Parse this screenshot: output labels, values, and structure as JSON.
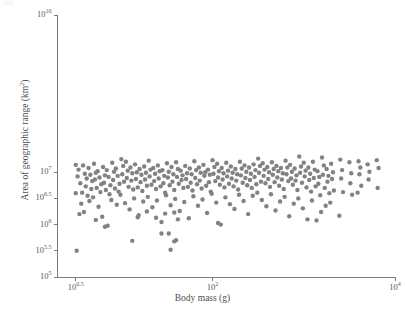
{
  "figure": {
    "caption_fragment": "(B)",
    "marker_color": "#808285",
    "axis_color": "#6d6e71",
    "background": "#ffffff"
  },
  "chart_data": {
    "type": "scatter",
    "title": "",
    "xlabel": "Body mass (g)",
    "ylabel": "Area of geographic range (km²)",
    "xscale": "log",
    "yscale": "log",
    "xlim_log10": [
      0.3,
      4.0
    ],
    "ylim_log10": [
      5.0,
      10.0
    ],
    "grid": false,
    "legend": null,
    "xticks_log10": [
      0.5,
      2.0,
      4.0
    ],
    "xtick_labels": [
      "10^0.5",
      "10^2",
      "10^4"
    ],
    "yticks_log10": [
      5.0,
      5.5,
      6.0,
      6.5,
      7.0,
      10.0
    ],
    "ytick_labels": [
      "10^5",
      "10^5.5",
      "10^6",
      "10^6.5",
      "10^7",
      "10^10"
    ],
    "marker_size_px": 4.4,
    "n_points": 301,
    "points_log10": [
      [
        0.5,
        7.14
      ],
      [
        0.52,
        6.92
      ],
      [
        0.5,
        6.6
      ],
      [
        0.51,
        5.5
      ],
      [
        0.53,
        7.05
      ],
      [
        0.55,
        6.79
      ],
      [
        0.57,
        6.61
      ],
      [
        0.56,
        6.4
      ],
      [
        0.54,
        6.2
      ],
      [
        0.58,
        7.13
      ],
      [
        0.6,
        6.97
      ],
      [
        0.62,
        6.88
      ],
      [
        0.61,
        6.73
      ],
      [
        0.63,
        6.55
      ],
      [
        0.59,
        6.24
      ],
      [
        0.64,
        7.08
      ],
      [
        0.66,
        6.95
      ],
      [
        0.68,
        6.83
      ],
      [
        0.67,
        6.68
      ],
      [
        0.65,
        6.45
      ],
      [
        0.7,
        7.16
      ],
      [
        0.72,
        6.99
      ],
      [
        0.71,
        6.86
      ],
      [
        0.73,
        6.7
      ],
      [
        0.69,
        6.52
      ],
      [
        0.74,
        7.02
      ],
      [
        0.76,
        6.9
      ],
      [
        0.78,
        6.77
      ],
      [
        0.77,
        6.62
      ],
      [
        0.75,
        6.34
      ],
      [
        0.8,
        7.1
      ],
      [
        0.82,
        6.94
      ],
      [
        0.81,
        6.8
      ],
      [
        0.83,
        6.66
      ],
      [
        0.79,
        6.15
      ],
      [
        0.84,
        7.04
      ],
      [
        0.86,
        6.91
      ],
      [
        0.88,
        6.75
      ],
      [
        0.87,
        6.58
      ],
      [
        0.85,
        5.98
      ],
      [
        0.9,
        7.18
      ],
      [
        0.92,
        7.01
      ],
      [
        0.91,
        6.85
      ],
      [
        0.93,
        6.69
      ],
      [
        0.89,
        6.47
      ],
      [
        0.94,
        7.07
      ],
      [
        0.96,
        6.93
      ],
      [
        0.98,
        6.78
      ],
      [
        0.97,
        6.63
      ],
      [
        0.95,
        6.38
      ],
      [
        1.0,
        7.25
      ],
      [
        1.02,
        7.12
      ],
      [
        1.01,
        6.96
      ],
      [
        1.03,
        6.82
      ],
      [
        0.99,
        6.57
      ],
      [
        1.05,
        7.2
      ],
      [
        1.07,
        7.03
      ],
      [
        1.06,
        6.89
      ],
      [
        1.08,
        6.72
      ],
      [
        1.04,
        6.41
      ],
      [
        1.1,
        7.09
      ],
      [
        1.12,
        6.98
      ],
      [
        1.11,
        6.84
      ],
      [
        1.13,
        6.67
      ],
      [
        1.09,
        6.29
      ],
      [
        1.15,
        7.15
      ],
      [
        1.17,
        7.0
      ],
      [
        1.16,
        6.87
      ],
      [
        1.18,
        6.71
      ],
      [
        1.14,
        6.5
      ],
      [
        1.2,
        7.06
      ],
      [
        1.22,
        6.95
      ],
      [
        1.21,
        6.81
      ],
      [
        1.23,
        6.64
      ],
      [
        1.19,
        6.18
      ],
      [
        1.25,
        7.11
      ],
      [
        1.27,
        6.99
      ],
      [
        1.26,
        6.86
      ],
      [
        1.28,
        6.74
      ],
      [
        1.24,
        6.44
      ],
      [
        1.3,
        7.22
      ],
      [
        1.32,
        7.05
      ],
      [
        1.31,
        6.92
      ],
      [
        1.33,
        6.76
      ],
      [
        1.29,
        6.53
      ],
      [
        1.35,
        7.08
      ],
      [
        1.37,
        6.97
      ],
      [
        1.36,
        6.83
      ],
      [
        1.38,
        6.68
      ],
      [
        1.34,
        6.33
      ],
      [
        1.4,
        7.13
      ],
      [
        1.42,
        7.02
      ],
      [
        1.41,
        6.88
      ],
      [
        1.43,
        6.73
      ],
      [
        1.39,
        6.46
      ],
      [
        1.45,
        7.04
      ],
      [
        1.47,
        6.93
      ],
      [
        1.46,
        6.79
      ],
      [
        1.48,
        6.61
      ],
      [
        1.44,
        6.05
      ],
      [
        1.5,
        7.17
      ],
      [
        1.52,
        7.01
      ],
      [
        1.51,
        6.9
      ],
      [
        1.53,
        6.75
      ],
      [
        1.49,
        6.56
      ],
      [
        1.55,
        7.1
      ],
      [
        1.57,
        6.96
      ],
      [
        1.56,
        6.82
      ],
      [
        1.58,
        6.66
      ],
      [
        1.54,
        6.37
      ],
      [
        1.6,
        7.19
      ],
      [
        1.62,
        7.06
      ],
      [
        1.61,
        6.91
      ],
      [
        1.63,
        6.78
      ],
      [
        1.59,
        6.49
      ],
      [
        1.65,
        7.03
      ],
      [
        1.67,
        6.94
      ],
      [
        1.66,
        6.85
      ],
      [
        1.68,
        6.7
      ],
      [
        1.64,
        6.26
      ],
      [
        1.7,
        7.12
      ],
      [
        1.72,
        6.98
      ],
      [
        1.71,
        6.87
      ],
      [
        1.73,
        6.72
      ],
      [
        1.69,
        6.43
      ],
      [
        1.75,
        7.07
      ],
      [
        1.77,
        6.96
      ],
      [
        1.76,
        6.8
      ],
      [
        1.78,
        6.65
      ],
      [
        1.74,
        6.12
      ],
      [
        1.8,
        7.21
      ],
      [
        1.82,
        7.04
      ],
      [
        1.81,
        6.89
      ],
      [
        1.83,
        6.77
      ],
      [
        1.79,
        6.54
      ],
      [
        1.85,
        7.09
      ],
      [
        1.87,
        6.99
      ],
      [
        1.86,
        6.84
      ],
      [
        1.88,
        6.69
      ],
      [
        1.84,
        6.36
      ],
      [
        1.9,
        7.14
      ],
      [
        1.92,
        7.0
      ],
      [
        1.91,
        6.93
      ],
      [
        1.93,
        6.74
      ],
      [
        1.89,
        6.48
      ],
      [
        1.95,
        7.05
      ],
      [
        1.97,
        6.95
      ],
      [
        1.96,
        6.81
      ],
      [
        1.98,
        6.63
      ],
      [
        1.94,
        6.22
      ],
      [
        2.0,
        7.23
      ],
      [
        2.02,
        7.1
      ],
      [
        2.01,
        6.97
      ],
      [
        2.03,
        6.83
      ],
      [
        1.99,
        6.59
      ],
      [
        2.05,
        7.16
      ],
      [
        2.07,
        7.02
      ],
      [
        2.06,
        6.9
      ],
      [
        2.08,
        6.76
      ],
      [
        2.04,
        6.42
      ],
      [
        2.1,
        7.08
      ],
      [
        2.12,
        6.98
      ],
      [
        2.11,
        6.86
      ],
      [
        2.13,
        6.71
      ],
      [
        2.09,
        6.0
      ],
      [
        2.15,
        7.18
      ],
      [
        2.17,
        7.03
      ],
      [
        2.16,
        6.92
      ],
      [
        2.18,
        6.78
      ],
      [
        2.14,
        6.52
      ],
      [
        2.2,
        7.11
      ],
      [
        2.22,
        6.99
      ],
      [
        2.21,
        6.88
      ],
      [
        2.23,
        6.73
      ],
      [
        2.19,
        6.39
      ],
      [
        2.25,
        7.06
      ],
      [
        2.27,
        6.96
      ],
      [
        2.26,
        6.84
      ],
      [
        2.28,
        6.67
      ],
      [
        2.24,
        6.3
      ],
      [
        2.3,
        7.2
      ],
      [
        2.32,
        7.07
      ],
      [
        2.31,
        6.94
      ],
      [
        2.33,
        6.8
      ],
      [
        2.29,
        6.57
      ],
      [
        2.35,
        7.13
      ],
      [
        2.37,
        7.01
      ],
      [
        2.36,
        6.89
      ],
      [
        2.38,
        6.75
      ],
      [
        2.34,
        6.45
      ],
      [
        2.4,
        7.09
      ],
      [
        2.42,
        6.97
      ],
      [
        2.41,
        6.85
      ],
      [
        2.43,
        6.7
      ],
      [
        2.39,
        6.2
      ],
      [
        2.45,
        7.15
      ],
      [
        2.47,
        7.04
      ],
      [
        2.46,
        6.91
      ],
      [
        2.48,
        6.77
      ],
      [
        2.44,
        6.55
      ],
      [
        2.5,
        7.26
      ],
      [
        2.52,
        7.12
      ],
      [
        2.51,
        6.99
      ],
      [
        2.53,
        6.82
      ],
      [
        2.49,
        6.61
      ],
      [
        2.55,
        7.17
      ],
      [
        2.57,
        7.05
      ],
      [
        2.56,
        6.93
      ],
      [
        2.58,
        6.79
      ],
      [
        2.54,
        6.47
      ],
      [
        2.6,
        7.1
      ],
      [
        2.62,
        7.0
      ],
      [
        2.61,
        6.87
      ],
      [
        2.63,
        6.72
      ],
      [
        2.59,
        6.35
      ],
      [
        2.65,
        7.19
      ],
      [
        2.67,
        7.06
      ],
      [
        2.66,
        6.95
      ],
      [
        2.68,
        6.81
      ],
      [
        2.64,
        6.58
      ],
      [
        2.7,
        7.12
      ],
      [
        2.72,
        7.02
      ],
      [
        2.71,
        6.9
      ],
      [
        2.73,
        6.74
      ],
      [
        2.69,
        6.27
      ],
      [
        2.75,
        7.08
      ],
      [
        2.77,
        6.98
      ],
      [
        2.76,
        6.86
      ],
      [
        2.78,
        6.68
      ],
      [
        2.74,
        6.44
      ],
      [
        2.8,
        7.22
      ],
      [
        2.82,
        7.09
      ],
      [
        2.81,
        6.96
      ],
      [
        2.83,
        6.83
      ],
      [
        2.79,
        6.53
      ],
      [
        2.85,
        7.14
      ],
      [
        2.87,
        7.01
      ],
      [
        2.86,
        6.88
      ],
      [
        2.88,
        6.76
      ],
      [
        2.84,
        6.16
      ],
      [
        2.9,
        7.07
      ],
      [
        2.92,
        6.94
      ],
      [
        2.91,
        6.84
      ],
      [
        2.93,
        6.66
      ],
      [
        2.89,
        6.4
      ],
      [
        2.95,
        7.3
      ],
      [
        2.97,
        7.11
      ],
      [
        2.96,
        6.99
      ],
      [
        2.98,
        6.8
      ],
      [
        2.94,
        6.5
      ],
      [
        3.0,
        7.18
      ],
      [
        3.02,
        7.03
      ],
      [
        3.01,
        6.92
      ],
      [
        3.03,
        6.71
      ],
      [
        2.99,
        6.31
      ],
      [
        3.05,
        7.09
      ],
      [
        3.07,
        6.97
      ],
      [
        3.06,
        6.85
      ],
      [
        3.08,
        6.63
      ],
      [
        3.04,
        6.1
      ],
      [
        3.1,
        7.2
      ],
      [
        3.12,
        7.05
      ],
      [
        3.11,
        6.89
      ],
      [
        3.13,
        6.73
      ],
      [
        3.09,
        6.46
      ],
      [
        3.15,
        7.02
      ],
      [
        3.17,
        6.91
      ],
      [
        3.16,
        6.78
      ],
      [
        3.18,
        6.56
      ],
      [
        3.14,
        6.08
      ],
      [
        3.2,
        7.28
      ],
      [
        3.22,
        7.13
      ],
      [
        3.21,
        6.95
      ],
      [
        3.23,
        6.7
      ],
      [
        3.19,
        6.24
      ],
      [
        3.25,
        7.06
      ],
      [
        3.27,
        6.93
      ],
      [
        3.26,
        6.82
      ],
      [
        3.28,
        6.6
      ],
      [
        3.24,
        6.36
      ],
      [
        3.3,
        7.16
      ],
      [
        3.32,
        7.0
      ],
      [
        3.31,
        6.87
      ],
      [
        3.33,
        6.65
      ],
      [
        3.29,
        6.42
      ],
      [
        3.4,
        7.24
      ],
      [
        3.42,
        7.04
      ],
      [
        3.41,
        6.88
      ],
      [
        3.43,
        6.62
      ],
      [
        3.39,
        6.17
      ],
      [
        3.5,
        7.19
      ],
      [
        3.52,
        6.98
      ],
      [
        3.51,
        6.79
      ],
      [
        3.53,
        6.57
      ],
      [
        3.6,
        7.21
      ],
      [
        3.62,
        7.09
      ],
      [
        3.61,
        6.96
      ],
      [
        3.63,
        6.74
      ],
      [
        3.59,
        6.61
      ],
      [
        3.7,
        7.15
      ],
      [
        3.72,
        7.01
      ],
      [
        3.71,
        6.86
      ],
      [
        3.8,
        7.23
      ],
      [
        3.82,
        7.08
      ],
      [
        3.81,
        6.7
      ],
      [
        0.72,
        6.09
      ],
      [
        0.82,
        5.96
      ],
      [
        1.28,
        6.25
      ],
      [
        1.48,
        6.21
      ],
      [
        1.58,
        6.23
      ],
      [
        1.18,
        6.14
      ],
      [
        1.38,
        6.13
      ],
      [
        1.62,
        6.1
      ],
      [
        2.06,
        6.03
      ],
      [
        1.44,
        5.83
      ],
      [
        1.52,
        5.83
      ],
      [
        1.12,
        5.69
      ],
      [
        1.58,
        5.68
      ],
      [
        1.6,
        5.7
      ],
      [
        1.54,
        5.52
      ]
    ]
  }
}
